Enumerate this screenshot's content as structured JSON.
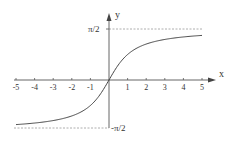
{
  "chart_data": {
    "type": "line",
    "title": "",
    "function": "y = arctan(x)",
    "xlabel": "x",
    "ylabel": "y",
    "xlim": [
      -5,
      5
    ],
    "ylim": [
      -1.5708,
      1.5708
    ],
    "x_ticks": [
      "-5",
      "-4",
      "-3",
      "-2",
      "-1",
      "1",
      "2",
      "3",
      "4",
      "5"
    ],
    "y_ticks": [
      "π/2",
      "-π/2"
    ],
    "asymptotes": [
      {
        "y": 1.5708,
        "label": "π/2",
        "style": "dashed"
      },
      {
        "y": -1.5708,
        "label": "-π/2",
        "style": "dashed"
      }
    ],
    "series": [
      {
        "name": "arctan(x)",
        "x": [
          -5,
          -4,
          -3,
          -2,
          -1,
          -0.5,
          0,
          0.5,
          1,
          2,
          3,
          4,
          5
        ],
        "values": [
          -1.373,
          -1.326,
          -1.249,
          -1.107,
          -0.785,
          -0.464,
          0,
          0.464,
          0.785,
          1.107,
          1.249,
          1.326,
          1.373
        ]
      }
    ],
    "grid": false,
    "legend": null
  },
  "labels": {
    "x_axis": "x",
    "y_axis": "y",
    "pi_half": "π/2",
    "neg_pi_half": "-π/2"
  },
  "ticks": [
    {
      "label": "-5",
      "v": -5
    },
    {
      "label": "-4",
      "v": -4
    },
    {
      "label": "-3",
      "v": -3
    },
    {
      "label": "-2",
      "v": -2
    },
    {
      "label": "-1",
      "v": -1
    },
    {
      "label": "1",
      "v": 1
    },
    {
      "label": "2",
      "v": 2
    },
    {
      "label": "3",
      "v": 3
    },
    {
      "label": "4",
      "v": 4
    },
    {
      "label": "5",
      "v": 5
    }
  ]
}
